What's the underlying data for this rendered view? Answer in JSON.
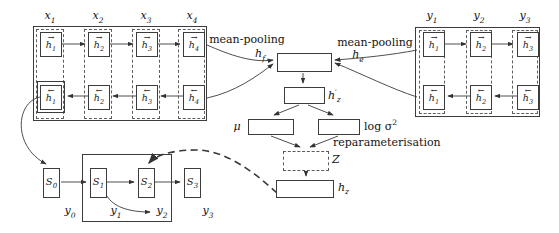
{
  "colors": {
    "ink": "#3a3a3a",
    "text": "#141414",
    "background": "#ffffff"
  },
  "encoder_x": {
    "inputs": [
      {
        "base": "x",
        "sub": "1"
      },
      {
        "base": "x",
        "sub": "2"
      },
      {
        "base": "x",
        "sub": "3"
      },
      {
        "base": "x",
        "sub": "4"
      }
    ],
    "forward": [
      {
        "arrow": "→",
        "base": "h",
        "sub": "1"
      },
      {
        "arrow": "→",
        "base": "h",
        "sub": "2"
      },
      {
        "arrow": "→",
        "base": "h",
        "sub": "3"
      },
      {
        "arrow": "→",
        "base": "h",
        "sub": "4"
      }
    ],
    "backward": [
      {
        "arrow": "←",
        "base": "h",
        "sub": "1"
      },
      {
        "arrow": "←",
        "base": "h",
        "sub": "2"
      },
      {
        "arrow": "←",
        "base": "h",
        "sub": "3"
      },
      {
        "arrow": "←",
        "base": "h",
        "sub": "4"
      }
    ]
  },
  "encoder_y": {
    "inputs": [
      {
        "base": "y",
        "sub": "1"
      },
      {
        "base": "y",
        "sub": "2"
      },
      {
        "base": "y",
        "sub": "3"
      }
    ],
    "forward": [
      {
        "arrow": "→",
        "base": "h",
        "sub": "1"
      },
      {
        "arrow": "→",
        "base": "h",
        "sub": "2"
      },
      {
        "arrow": "→",
        "base": "h",
        "sub": "3"
      }
    ],
    "backward": [
      {
        "arrow": "←",
        "base": "h",
        "sub": "1"
      },
      {
        "arrow": "←",
        "base": "h",
        "sub": "2"
      },
      {
        "arrow": "←",
        "base": "h",
        "sub": "3"
      }
    ]
  },
  "pooling": {
    "left_label": "mean-pooling",
    "right_label": "mean-pooling",
    "hf": {
      "base": "h",
      "sub": "f"
    },
    "he": {
      "base": "h",
      "sub": "e"
    }
  },
  "latent": {
    "hz_prime": {
      "base": "h",
      "sup": "′",
      "sub": "z"
    },
    "mu": "μ",
    "log_sigma": {
      "text": "log σ",
      "sup": "2"
    },
    "reparam_label": "reparameterisation",
    "z": "Z",
    "hz": {
      "base": "h",
      "sub": "z"
    }
  },
  "decoder": {
    "states": [
      {
        "base": "S",
        "sub": "0"
      },
      {
        "base": "S",
        "sub": "1"
      },
      {
        "base": "S",
        "sub": "2"
      },
      {
        "base": "S",
        "sub": "3"
      }
    ],
    "outputs": [
      {
        "base": "y",
        "sub": "0"
      },
      {
        "base": "y",
        "sub": "1"
      },
      {
        "base": "y",
        "sub": "2"
      },
      {
        "base": "y",
        "sub": "3"
      }
    ]
  }
}
